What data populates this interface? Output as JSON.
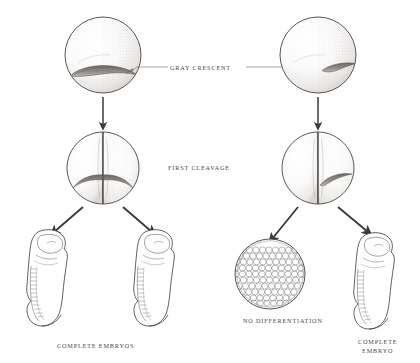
{
  "figure": {
    "background_color": "#ffffff",
    "ink_color": "#3d3b38",
    "stipple_color": "#8d8a85",
    "text_color": "#4a4845",
    "width": 420,
    "height": 363
  },
  "labels": {
    "gray_crescent": "GRAY CRESCENT",
    "first_cleavage": "FIRST CLEAVAGE",
    "complete_embryos": "COMPLETE EMBRYOS",
    "no_differentiation": "NO DIFFERENTIATION",
    "complete_embryo_line1": "COMPLETE",
    "complete_embryo_line2": "EMBRYO"
  },
  "stages": {
    "left_egg": {
      "name": "fertilized-egg-symmetric-division",
      "crescent_position": "centered at vegetal pole, bisected by cleavage plane"
    },
    "right_egg": {
      "name": "fertilized-egg-asymmetric-division",
      "crescent_position": "offset to right, entirely in one blastomere"
    },
    "left_two_cell": {
      "name": "two-cell-stage-crescent-shared",
      "outcome": "both blastomeres receive gray crescent"
    },
    "right_two_cell": {
      "name": "two-cell-stage-crescent-one-cell",
      "outcome": "only right blastomere receives gray crescent"
    },
    "left_outcomes": [
      "complete embryo",
      "complete embryo"
    ],
    "right_outcomes": [
      "undifferentiated ball of cells",
      "complete embryo"
    ]
  },
  "arrows": {
    "left_vertical": "egg to two-cell stage",
    "right_vertical": "egg to two-cell stage",
    "left_down_left": "two-cell to complete embryo",
    "left_down_right": "two-cell to complete embryo",
    "right_down_left": "two-cell to undifferentiated ball",
    "right_down_right": "two-cell to complete embryo"
  }
}
